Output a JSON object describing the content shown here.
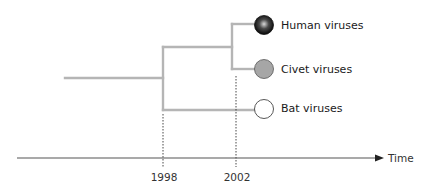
{
  "diagram": {
    "title": "",
    "type": "phylogenetic-tree-timeline",
    "leaves": [
      {
        "label": "Human viruses",
        "fill": "gradient-black",
        "marker": "dark sphere"
      },
      {
        "label": "Civet viruses",
        "fill": "#a6a6a6",
        "marker": "gray circle"
      },
      {
        "label": "Bat viruses",
        "fill": "#ffffff",
        "marker": "white circle"
      }
    ],
    "branch_color": "#b5b5b5",
    "timeline": {
      "axis_label": "Time",
      "ticks": [
        {
          "label": "1998"
        },
        {
          "label": "2002"
        }
      ]
    }
  }
}
